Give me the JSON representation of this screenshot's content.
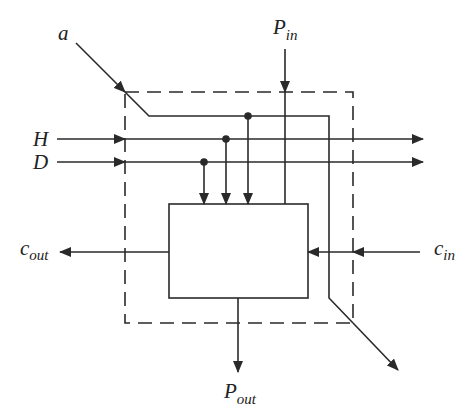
{
  "diagram": {
    "type": "block-diagram",
    "colors": {
      "stroke": "#2a2a2a",
      "background": "#ffffff"
    },
    "labels": {
      "a": {
        "main": "a",
        "sub": ""
      },
      "H": {
        "main": "H",
        "sub": ""
      },
      "D": {
        "main": "D",
        "sub": ""
      },
      "p_in": {
        "main": "P",
        "sub": "in"
      },
      "p_out": {
        "main": "P",
        "sub": "out"
      },
      "c_in": {
        "main": "c",
        "sub": "in"
      },
      "c_out": {
        "main": "c",
        "sub": "out"
      }
    },
    "boundary": {
      "style": "dashed",
      "x": 125,
      "y": 92,
      "width": 228,
      "height": 231
    },
    "cell": {
      "style": "solid",
      "x": 169,
      "y": 204,
      "width": 139,
      "height": 94
    },
    "taps": [
      {
        "signal": "a",
        "dot": [
          248,
          116
        ]
      },
      {
        "signal": "H",
        "dot": [
          226,
          139
        ]
      },
      {
        "signal": "D",
        "dot": [
          204,
          162
        ]
      }
    ]
  }
}
